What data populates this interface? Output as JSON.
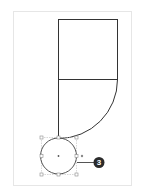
{
  "diagram": {
    "page": {
      "x": 13,
      "y": 11,
      "width": 118,
      "height": 174,
      "border_color": "#e6e6e6"
    },
    "shape": {
      "rect": {
        "x": 58,
        "y": 19,
        "width": 59,
        "height": 60
      },
      "divider_y": 79,
      "arc": {
        "start": [
          117,
          79
        ],
        "end": [
          58,
          138
        ],
        "radius": 59
      },
      "stroke_color": "#333333"
    },
    "selected_circle": {
      "cx": 58,
      "cy": 156,
      "r": 18,
      "handle_color": "#9a9a9a",
      "stroke_color": "#555555"
    },
    "callout": {
      "label": "3",
      "badge_color": "#2b2b2b",
      "leader_color": "#555555",
      "cx": 99,
      "cy": 162
    }
  }
}
